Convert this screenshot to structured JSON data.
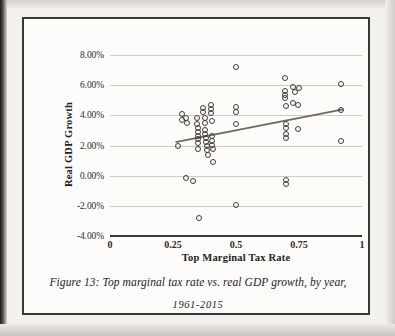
{
  "figure": {
    "caption_line1": "Figure 13: Top marginal tax rate vs. real GDP growth, by year,",
    "caption_line2": "1961-2015",
    "border_color": "#3a3734",
    "page_color": "#fdfcfa"
  },
  "chart_data": {
    "type": "scatter",
    "title": "",
    "xlabel": "Top Marginal Tax Rate",
    "ylabel": "Real GDP Growth",
    "xlim": [
      0,
      1
    ],
    "ylim": [
      -0.04,
      0.08
    ],
    "grid": true,
    "legend": "none",
    "marker": "open-circle",
    "marker_color": "#413d38",
    "xticks": [
      "0",
      "0.25",
      "0.5",
      "0.75",
      "1"
    ],
    "xtick_values": [
      0,
      0.25,
      0.5,
      0.75,
      1
    ],
    "yticks": [
      "8.00%",
      "6.00%",
      "4.00%",
      "2.00%",
      "0.00%",
      "-2.00%",
      "-4.00%"
    ],
    "ytick_values": [
      0.08,
      0.06,
      0.04,
      0.02,
      0.0,
      -0.02,
      -0.04
    ],
    "points": [
      [
        0.27,
        0.0195
      ],
      [
        0.285,
        0.0408
      ],
      [
        0.285,
        0.037
      ],
      [
        0.3,
        0.038
      ],
      [
        0.305,
        0.035
      ],
      [
        0.3,
        -0.0015
      ],
      [
        0.33,
        -0.0035
      ],
      [
        0.345,
        0.0385
      ],
      [
        0.345,
        0.034
      ],
      [
        0.35,
        0.0318
      ],
      [
        0.35,
        0.029
      ],
      [
        0.35,
        0.0265
      ],
      [
        0.35,
        0.024
      ],
      [
        0.35,
        0.0215
      ],
      [
        0.35,
        0.0178
      ],
      [
        0.355,
        -0.028
      ],
      [
        0.37,
        0.045
      ],
      [
        0.37,
        0.042
      ],
      [
        0.375,
        0.0385
      ],
      [
        0.375,
        0.0352
      ],
      [
        0.375,
        0.0305
      ],
      [
        0.375,
        0.0275
      ],
      [
        0.38,
        0.0248
      ],
      [
        0.38,
        0.0222
      ],
      [
        0.385,
        0.0195
      ],
      [
        0.385,
        0.0168
      ],
      [
        0.39,
        0.0137
      ],
      [
        0.4,
        0.047
      ],
      [
        0.4,
        0.044
      ],
      [
        0.4,
        0.0415
      ],
      [
        0.405,
        0.036
      ],
      [
        0.405,
        0.0262
      ],
      [
        0.405,
        0.0232
      ],
      [
        0.405,
        0.0205
      ],
      [
        0.41,
        0.0175
      ],
      [
        0.41,
        0.0092
      ],
      [
        0.5,
        0.0722
      ],
      [
        0.5,
        0.0452
      ],
      [
        0.5,
        0.0425
      ],
      [
        0.5,
        0.0345
      ],
      [
        0.5,
        -0.0195
      ],
      [
        0.695,
        0.0645
      ],
      [
        0.695,
        0.056
      ],
      [
        0.695,
        0.0535
      ],
      [
        0.695,
        0.0512
      ],
      [
        0.7,
        0.0465
      ],
      [
        0.7,
        0.034
      ],
      [
        0.7,
        0.0315
      ],
      [
        0.7,
        0.0278
      ],
      [
        0.7,
        0.025
      ],
      [
        0.7,
        -0.003
      ],
      [
        0.7,
        -0.0055
      ],
      [
        0.725,
        0.0585
      ],
      [
        0.725,
        0.0485
      ],
      [
        0.735,
        0.0555
      ],
      [
        0.745,
        0.031
      ],
      [
        0.745,
        0.047
      ],
      [
        0.75,
        0.058
      ],
      [
        0.915,
        0.0608
      ],
      [
        0.915,
        0.0437
      ],
      [
        0.915,
        0.0228
      ]
    ],
    "trendline": {
      "x0": 0.26,
      "y0": 0.0222,
      "x1": 0.925,
      "y1": 0.044,
      "color": "#6d6a60"
    }
  }
}
